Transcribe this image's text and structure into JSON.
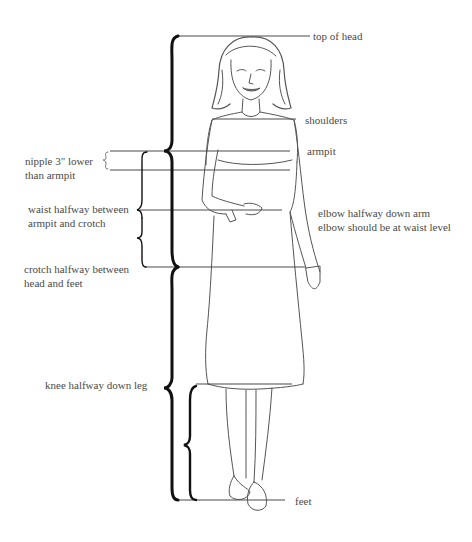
{
  "diagram": {
    "type": "body proportion guide (female figure)",
    "colors": {
      "line": "#4a4a4a",
      "brace": "#111111",
      "text": "#4a4a4a",
      "sketch": "#555555",
      "background": "#ffffff"
    },
    "labels": {
      "top_of_head": "top of head",
      "shoulders": "shoulders",
      "armpit": "armpit",
      "nipple_line1": "nipple 3\" lower",
      "nipple_line2": "than armpit",
      "waist_line1": "waist halfway between",
      "waist_line2": "armpit and crotch",
      "elbow_line1": "elbow halfway down arm",
      "elbow_line2": "elbow should be at waist level",
      "crotch_line1": "crotch halfway between",
      "crotch_line2": "head and feet",
      "knee": "knee halfway down leg",
      "feet": "feet"
    },
    "landmarks": [
      {
        "name": "top of head",
        "y": 36
      },
      {
        "name": "shoulders",
        "y": 119
      },
      {
        "name": "armpit",
        "y": 151
      },
      {
        "name": "nipple",
        "y": 170
      },
      {
        "name": "waist / elbow",
        "y": 210
      },
      {
        "name": "crotch",
        "y": 267
      },
      {
        "name": "knee",
        "y": 384
      },
      {
        "name": "feet",
        "y": 500
      }
    ],
    "braces": [
      {
        "name": "head to crotch",
        "from": "top of head",
        "to": "crotch"
      },
      {
        "name": "crotch to feet",
        "from": "crotch",
        "to": "feet"
      },
      {
        "name": "armpit to nipple",
        "from": "armpit",
        "to": "nipple"
      },
      {
        "name": "armpit to waist",
        "from": "armpit",
        "to": "waist"
      },
      {
        "name": "waist to crotch",
        "from": "waist",
        "to": "crotch"
      },
      {
        "name": "knee to feet",
        "from": "knee",
        "to": "feet"
      }
    ]
  }
}
